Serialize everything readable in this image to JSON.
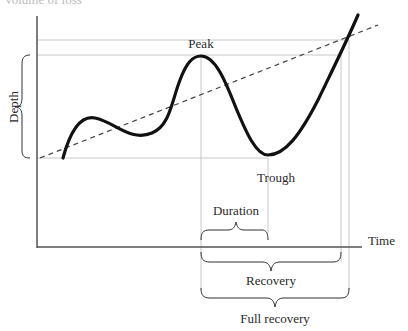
{
  "figure": {
    "top_caption_partial": "Volume of loss",
    "axes": {
      "x_label": "Time",
      "y_label": "Depth"
    },
    "points": {
      "peak_label": "Peak",
      "trough_label": "Trough"
    },
    "braces": {
      "duration_label": "Duration",
      "recovery_label": "Recovery",
      "full_recovery_label": "Full recovery"
    },
    "colors": {
      "curve": "#111111",
      "axis": "#555555",
      "guide_lines": "#c8c8c8",
      "trend_line": "#444444",
      "text": "#2a2a2a"
    }
  }
}
